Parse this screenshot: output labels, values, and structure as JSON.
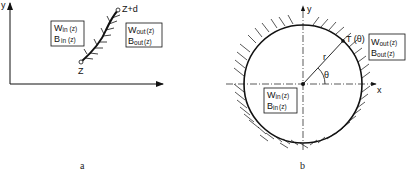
{
  "panel_a": {
    "caption": "a",
    "y_axis_label": "y",
    "start_point_label": "Z",
    "end_point_label": "Z+d",
    "inner_box": {
      "line1_main": "W",
      "line1_sub": "in",
      "line1_arg": "(z)",
      "line2_main": "B",
      "line2_sub": "in",
      "line2_arg": "(z)"
    },
    "outer_box": {
      "line1_main": "W",
      "line1_sub": "out",
      "line1_arg": "(z)",
      "line2_main": "B",
      "line2_sub": "out",
      "line2_arg": "(z)"
    }
  },
  "panel_b": {
    "caption": "b",
    "y_axis_label": "y",
    "x_axis_label": "x",
    "radius_label": "r",
    "angle_label": "θ",
    "point_label": "T (θ)",
    "inner_box": {
      "line1_main": "W",
      "line1_sub": "in",
      "line1_arg": "(z)",
      "line2_main": "B",
      "line2_sub": "in",
      "line2_arg": "(z)"
    },
    "outer_box": {
      "line1_main": "W",
      "line1_sub": "out",
      "line1_arg": "(z)",
      "line2_main": "B",
      "line2_sub": "out",
      "line2_arg": "(z)"
    }
  },
  "colors": {
    "ink": "#111111",
    "background": "#ffffff"
  }
}
